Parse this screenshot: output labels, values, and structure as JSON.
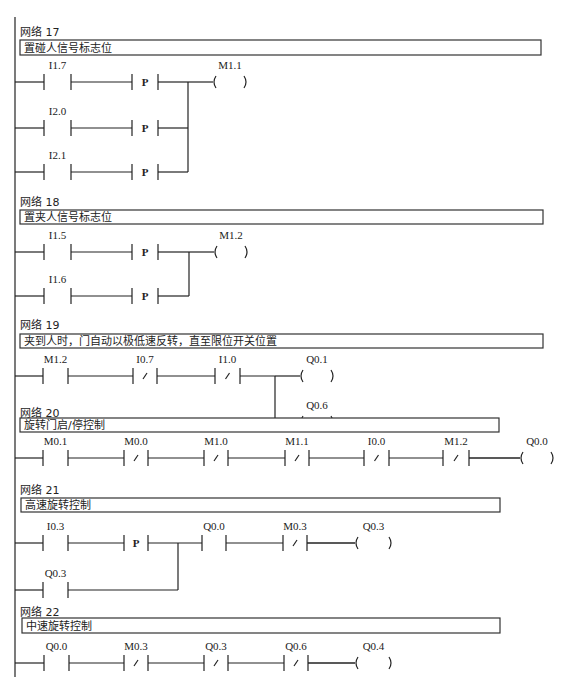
{
  "diagram_type": "ladder-logic",
  "rail": {
    "x": 15,
    "y1": 17,
    "y2": 677
  },
  "networks": [
    {
      "id": 17,
      "title": "网络 17",
      "comment": "置碰人信号标志位",
      "title_y": 36,
      "box": {
        "x": 20,
        "y": 40,
        "w": 521,
        "h": 15
      },
      "rungs": [
        {
          "y": 82,
          "elements": [
            {
              "type": "NO",
              "label": "I1.7",
              "x": 44,
              "w": 27
            },
            {
              "type": "P",
              "label": "P",
              "x": 132,
              "w": 26
            }
          ],
          "end_x": 188
        },
        {
          "y": 128,
          "elements": [
            {
              "type": "NO",
              "label": "I2.0",
              "x": 44,
              "w": 27
            },
            {
              "type": "P",
              "label": "P",
              "x": 132,
              "w": 26
            }
          ],
          "end_x": 188
        },
        {
          "y": 172,
          "elements": [
            {
              "type": "NO",
              "label": "I2.1",
              "x": 44,
              "w": 27
            },
            {
              "type": "P",
              "label": "P",
              "x": 132,
              "w": 26
            }
          ],
          "end_x": 188
        }
      ],
      "branches": [
        {
          "x": 188,
          "y1": 82,
          "y2": 172
        }
      ],
      "coils": [
        {
          "label": "M1.1",
          "y": 82,
          "from_x": 188,
          "x": 213,
          "w": 34
        }
      ]
    },
    {
      "id": 18,
      "title": "网络 18",
      "comment": "置夹人信号标志位",
      "title_y": 206,
      "box": {
        "x": 20,
        "y": 210,
        "w": 523,
        "h": 14
      },
      "rungs": [
        {
          "y": 252,
          "elements": [
            {
              "type": "NO",
              "label": "I1.5",
              "x": 44,
              "w": 27
            },
            {
              "type": "P",
              "label": "P",
              "x": 132,
              "w": 26
            }
          ],
          "end_x": 189
        },
        {
          "y": 296,
          "elements": [
            {
              "type": "NO",
              "label": "I1.6",
              "x": 44,
              "w": 27
            },
            {
              "type": "P",
              "label": "P",
              "x": 132,
              "w": 26
            }
          ],
          "end_x": 189
        }
      ],
      "branches": [
        {
          "x": 189,
          "y1": 252,
          "y2": 296
        }
      ],
      "coils": [
        {
          "label": "M1.2",
          "y": 252,
          "from_x": 189,
          "x": 214,
          "w": 34
        }
      ]
    },
    {
      "id": 19,
      "title": "网络 19",
      "comment": "夹到人时，门自动以极低速反转，直至限位开关位置",
      "title_y": 329,
      "box": {
        "x": 20,
        "y": 334,
        "w": 523,
        "h": 14
      },
      "rungs": [
        {
          "y": 376,
          "elements": [
            {
              "type": "NO",
              "label": "M1.2",
              "x": 43,
              "w": 25
            },
            {
              "type": "NC",
              "label": "I0.7",
              "x": 133,
              "w": 24
            },
            {
              "type": "NC",
              "label": "I1.0",
              "x": 215,
              "w": 25
            }
          ],
          "end_x": 275
        }
      ],
      "branches": [
        {
          "x": 275,
          "y1": 376,
          "y2": 422
        }
      ],
      "coils": [
        {
          "label": "Q0.1",
          "y": 376,
          "from_x": 275,
          "x": 300,
          "w": 34
        },
        {
          "label": "Q0.6",
          "y": 422,
          "from_x": 275,
          "x": 300,
          "w": 34
        }
      ]
    },
    {
      "id": 20,
      "title": "网络 20",
      "comment": "旋转门启/停控制",
      "title_y": 417,
      "box": {
        "x": 20,
        "y": 418,
        "w": 479,
        "h": 14
      },
      "rungs": [
        {
          "y": 458,
          "elements": [
            {
              "type": "NO",
              "label": "M0.1",
              "x": 43,
              "w": 25
            },
            {
              "type": "NC",
              "label": "M0.0",
              "x": 124,
              "w": 24
            },
            {
              "type": "NC",
              "label": "M1.0",
              "x": 204,
              "w": 24
            },
            {
              "type": "NC",
              "label": "M1.1",
              "x": 285,
              "w": 24
            },
            {
              "type": "NC",
              "label": "I0.0",
              "x": 364,
              "w": 25
            },
            {
              "type": "NC",
              "label": "M1.2",
              "x": 443,
              "w": 26
            }
          ],
          "end_x": 520
        }
      ],
      "branches": [],
      "coils": [
        {
          "label": "Q0.0",
          "y": 458,
          "from_x": 469,
          "x": 520,
          "w": 34
        }
      ]
    },
    {
      "id": 21,
      "title": "网络 21",
      "comment": "高速旋转控制",
      "title_y": 494,
      "box": {
        "x": 21,
        "y": 498,
        "w": 479,
        "h": 14
      },
      "rungs": [
        {
          "y": 543,
          "elements": [
            {
              "type": "NO",
              "label": "I0.3",
              "x": 43,
              "w": 25
            },
            {
              "type": "P",
              "label": "P",
              "x": 124,
              "w": 24
            },
            {
              "type": "NO",
              "label": "Q0.0",
              "x": 202,
              "w": 24
            },
            {
              "type": "NC",
              "label": "M0.3",
              "x": 283,
              "w": 24
            }
          ],
          "end_x": 355
        },
        {
          "y": 590,
          "elements": [
            {
              "type": "NO",
              "label": "Q0.3",
              "x": 43,
              "w": 25
            }
          ],
          "end_x": 178
        }
      ],
      "branches": [
        {
          "x": 178,
          "y1": 543,
          "y2": 590
        }
      ],
      "coils": [
        {
          "label": "Q0.3",
          "y": 543,
          "from_x": 307,
          "x": 355,
          "w": 37
        }
      ]
    },
    {
      "id": 22,
      "title": "网络 22",
      "comment": "中速旋转控制",
      "title_y": 616,
      "box": {
        "x": 22,
        "y": 618,
        "w": 478,
        "h": 15
      },
      "rungs": [
        {
          "y": 663,
          "elements": [
            {
              "type": "NO",
              "label": "Q0.0",
              "x": 44,
              "w": 25
            },
            {
              "type": "NC",
              "label": "M0.3",
              "x": 124,
              "w": 24
            },
            {
              "type": "NC",
              "label": "Q0.3",
              "x": 204,
              "w": 24
            },
            {
              "type": "NC",
              "label": "Q0.6",
              "x": 284,
              "w": 24
            }
          ],
          "end_x": 355
        }
      ],
      "branches": [],
      "coils": [
        {
          "label": "Q0.4",
          "y": 663,
          "from_x": 308,
          "x": 355,
          "w": 37
        }
      ]
    }
  ]
}
